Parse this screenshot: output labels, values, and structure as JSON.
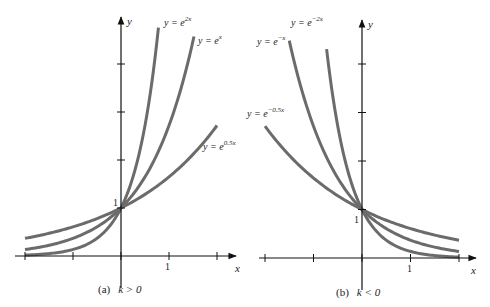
{
  "chart_data": [
    {
      "type": "line",
      "panel": "a",
      "caption_prefix": "(a)",
      "caption_cond": "k > 0",
      "xlabel": "x",
      "ylabel": "y",
      "xlim": [
        -2,
        2
      ],
      "ylim": [
        0,
        4.8
      ],
      "x_ticks": [
        -2,
        -1,
        0,
        1,
        2
      ],
      "x_tick_labels": [
        "",
        "",
        "",
        "1",
        ""
      ],
      "y_ticks": [
        1,
        2,
        3,
        4
      ],
      "y_tick_labels": [
        "1",
        "",
        "",
        ""
      ],
      "grid": false,
      "series": [
        {
          "name": "y = e^{2x}",
          "label_base": "y = e",
          "label_exp": "2x",
          "k": 2,
          "x_range": [
            -2,
            0.78
          ]
        },
        {
          "name": "y = e^{x}",
          "label_base": "y = e",
          "label_exp": "x",
          "k": 1,
          "x_range": [
            -2,
            1.52
          ]
        },
        {
          "name": "y = e^{0.5x}",
          "label_base": "y = e",
          "label_exp": "0.5x",
          "k": 0.5,
          "x_range": [
            -2,
            2.0
          ]
        }
      ]
    },
    {
      "type": "line",
      "panel": "b",
      "caption_prefix": "(b)",
      "caption_cond": "k < 0",
      "xlabel": "x",
      "ylabel": "y",
      "xlim": [
        -2,
        2
      ],
      "ylim": [
        0,
        4.8
      ],
      "x_ticks": [
        -2,
        -1,
        0,
        1,
        2
      ],
      "x_tick_labels": [
        "",
        "",
        "",
        "1",
        ""
      ],
      "y_ticks": [
        1,
        2,
        3,
        4
      ],
      "y_tick_labels": [
        "1",
        "",
        "",
        ""
      ],
      "grid": false,
      "series": [
        {
          "name": "y = e^{-2x}",
          "label_base": "y = e",
          "label_exp": "−2x",
          "k": -2,
          "x_range": [
            -0.73,
            2
          ]
        },
        {
          "name": "y = e^{-x}",
          "label_base": "y = e",
          "label_exp": "−x",
          "k": -1,
          "x_range": [
            -1.5,
            2
          ]
        },
        {
          "name": "y = e^{-0.5x}",
          "label_base": "y = e",
          "label_exp": "−0.5x",
          "k": -0.5,
          "x_range": [
            -2,
            2
          ]
        }
      ]
    }
  ],
  "style": {
    "curve_color": "#6b6b6b",
    "axis_color": "#111111"
  }
}
